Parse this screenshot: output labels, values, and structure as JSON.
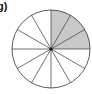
{
  "diagram": {
    "label": "g)",
    "type": "fraction-circle",
    "total_sectors": 12,
    "shaded_sectors": 3,
    "shaded_range_description": "top-right quadrant (12 o'clock to 3 o'clock)",
    "fraction_shaded": "3/12",
    "colors": {
      "shade": "#c8c8c8",
      "stroke": "#333333",
      "background": "#ffffff"
    }
  }
}
